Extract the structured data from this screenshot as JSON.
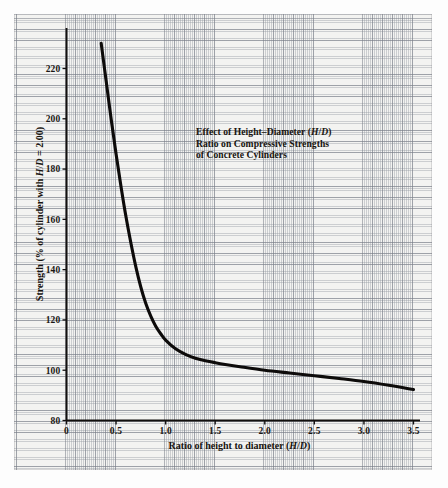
{
  "chart_data": {
    "type": "line",
    "title": "Effect of Height–Diameter (H/D) Ratio on Compressive Strengths of Concrete Cylinders",
    "title_lines": [
      "Effect of Height–Diameter (H/D)",
      "Ratio on Compressive Strengths",
      "of Concrete Cylinders"
    ],
    "xlabel": "Ratio of height to diameter (H/D)",
    "ylabel": "Strength (% of cylinder with H/D = 2.00)",
    "xlim": [
      0,
      3.5
    ],
    "ylim": [
      80,
      230
    ],
    "xticks": [
      "0",
      "0.5",
      "1.0",
      "1.5",
      "2.0",
      "2.5",
      "3.0",
      "3.5"
    ],
    "xtick_values": [
      0,
      0.5,
      1.0,
      1.5,
      2.0,
      2.5,
      3.0,
      3.5
    ],
    "yticks": [
      "80",
      "100",
      "120",
      "140",
      "160",
      "180",
      "200",
      "220"
    ],
    "ytick_values": [
      80,
      100,
      120,
      140,
      160,
      180,
      200,
      220
    ],
    "grid": "engineering graph paper, minor and major rules",
    "legend": "none",
    "series": [
      {
        "name": "Strength correction factor curve",
        "x": [
          0.35,
          0.4,
          0.45,
          0.5,
          0.55,
          0.6,
          0.65,
          0.7,
          0.75,
          0.8,
          0.85,
          0.9,
          0.95,
          1.0,
          1.1,
          1.2,
          1.3,
          1.4,
          1.5,
          1.6,
          1.75,
          2.0,
          2.25,
          2.5,
          2.75,
          3.0,
          3.25,
          3.5
        ],
        "y": [
          230.0,
          215.0,
          200.0,
          186.0,
          173.0,
          161.0,
          150.5,
          141.0,
          133.0,
          126.5,
          121.5,
          117.5,
          114.5,
          112.0,
          108.5,
          106.3,
          104.8,
          103.8,
          103.0,
          102.3,
          101.4,
          100.0,
          98.9,
          97.8,
          96.7,
          95.5,
          94.0,
          92.3
        ]
      }
    ],
    "colors": {
      "curve": "#0d0b0a",
      "axis": "#12100e",
      "paper": "#f3f3f1",
      "grid_major": "#787d87",
      "grid_minor": "#969ba3",
      "text": "#17140f",
      "page": "#fdfdfd"
    },
    "annotations": []
  }
}
